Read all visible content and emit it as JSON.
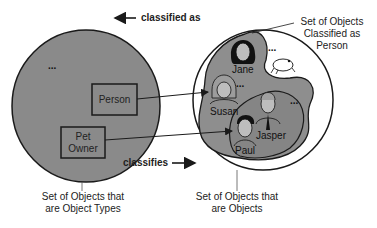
{
  "diagram": {
    "colors": {
      "circle_fill": "#8a8a8a",
      "blob_fill": "#8e8e8e",
      "inner_blob_fill": "#858585",
      "stroke": "#1a1a1a",
      "background": "#ffffff"
    },
    "arrows": {
      "classified_as": "classified as",
      "classifies": "classifies"
    },
    "left_set": {
      "ellipsis": "...",
      "types": [
        {
          "label": "Person"
        },
        {
          "label": "Pet Owner",
          "line1": "Pet",
          "line2": "Owner"
        }
      ],
      "caption_line1": "Set of Objects that",
      "caption_line2": "are Object Types"
    },
    "right_set": {
      "objects": [
        {
          "name": "Jane"
        },
        {
          "name": "Susan"
        },
        {
          "name": "Jasper"
        },
        {
          "name": "Paul"
        }
      ],
      "ellipsis_top": "...",
      "ellipsis_mid": "...",
      "ellipsis_right": "...",
      "frog_icon": "frog-icon",
      "classified_caption_line1": "Set of Objects",
      "classified_caption_line2": "Classified as",
      "classified_caption_line3": "Person",
      "caption_line1": "Set of Objects that",
      "caption_line2": "are Objects"
    }
  }
}
